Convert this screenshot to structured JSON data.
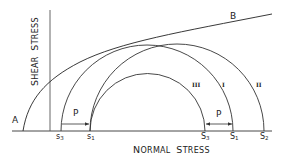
{
  "diagram": {
    "type": "Mohr circle diagram",
    "x_axis_label": "Normal Stress",
    "y_axis_label": "Shear Stress",
    "envelope": {
      "start_label": "A",
      "end_label": "B"
    },
    "circles": [
      {
        "id": "I",
        "label": "I",
        "left_label": "s3",
        "right_label": "S1"
      },
      {
        "id": "II",
        "label": "II",
        "left_label": "s1",
        "right_label": "S2"
      },
      {
        "id": "III",
        "label": "III",
        "left_label": "s1",
        "right_label": "S3"
      }
    ],
    "pressure_label": "P",
    "axis_ticks": [
      {
        "base": "s",
        "sub": "3"
      },
      {
        "base": "s",
        "sub": "1"
      },
      {
        "base": "S",
        "sub": "3"
      },
      {
        "base": "S",
        "sub": "1"
      },
      {
        "base": "S",
        "sub": "2"
      }
    ],
    "colors": {
      "line": "#333333",
      "background": "#ffffff"
    }
  },
  "labels": {
    "A": "A",
    "B": "B",
    "P_left": "P",
    "P_right": "P",
    "roman_I": "I",
    "roman_II": "II",
    "roman_III": "III",
    "normal_first": "N",
    "normal_rest": "ORMAL",
    "stress_first": "S",
    "stress_rest": "TRESS",
    "shear_first": "S",
    "shear_rest": "HEAR",
    "shear_stress_first": "S",
    "shear_stress_rest": "TRESS",
    "tick_s3_base": "s",
    "tick_s3_sub": "3",
    "tick_s1_base": "s",
    "tick_s1_sub": "1",
    "tick_S3_base": "S",
    "tick_S3_sub": "3",
    "tick_S1_base": "S",
    "tick_S1_sub": "1",
    "tick_S2_base": "S",
    "tick_S2_sub": "2"
  }
}
